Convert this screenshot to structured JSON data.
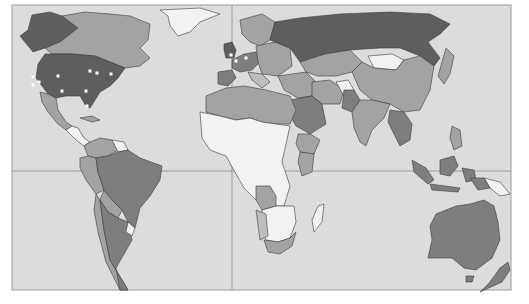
{
  "map": {
    "type": "world-choropleth",
    "projection": "world (Pacific-cut), equator and prime-meridian reference lines",
    "palette": {
      "ocean": "#dcdcdc",
      "frame": "#9a9a9a",
      "grid_line": "#8c8c8c",
      "level_1_lightest": "#f2f2f2",
      "level_2_light": "#bdbdbd",
      "level_3_medium": "#a3a3a3",
      "level_4_dark": "#7e7e7e",
      "level_5_darkest": "#5e5e5e",
      "marker": "#ffffff"
    },
    "regions": [
      {
        "name": "Alaska",
        "level": 5
      },
      {
        "name": "Canada",
        "level": 3
      },
      {
        "name": "Greenland",
        "level": 1
      },
      {
        "name": "United States",
        "level": 5
      },
      {
        "name": "Mexico",
        "level": 3
      },
      {
        "name": "Central America",
        "level": 1
      },
      {
        "name": "Caribbean",
        "level": 3
      },
      {
        "name": "Colombia / Venezuela",
        "level": 3
      },
      {
        "name": "Guianas",
        "level": 1
      },
      {
        "name": "Brazil",
        "level": 4
      },
      {
        "name": "Peru / Ecuador",
        "level": 3
      },
      {
        "name": "Bolivia",
        "level": 3
      },
      {
        "name": "Paraguay",
        "level": 3
      },
      {
        "name": "Chile",
        "level": 3
      },
      {
        "name": "Argentina",
        "level": 4
      },
      {
        "name": "Uruguay",
        "level": 1
      },
      {
        "name": "United Kingdom",
        "level": 5
      },
      {
        "name": "Scandinavia",
        "level": 3
      },
      {
        "name": "Western Europe",
        "level": 4
      },
      {
        "name": "Iberia",
        "level": 4
      },
      {
        "name": "Eastern Europe",
        "level": 3
      },
      {
        "name": "Russia",
        "level": 5
      },
      {
        "name": "Kazakhstan / Central Asia",
        "level": 3
      },
      {
        "name": "Mongolia",
        "level": 1
      },
      {
        "name": "China",
        "level": 3
      },
      {
        "name": "Japan / Korea",
        "level": 3
      },
      {
        "name": "Middle East",
        "level": 3
      },
      {
        "name": "Saudi Arabia",
        "level": 4
      },
      {
        "name": "Iran",
        "level": 3
      },
      {
        "name": "Afghanistan",
        "level": 1
      },
      {
        "name": "Pakistan",
        "level": 4
      },
      {
        "name": "India",
        "level": 3
      },
      {
        "name": "Southeast Asia",
        "level": 4
      },
      {
        "name": "Indonesia",
        "level": 4
      },
      {
        "name": "Philippines",
        "level": 3
      },
      {
        "name": "Papua New Guinea",
        "level": 1
      },
      {
        "name": "Australia",
        "level": 4
      },
      {
        "name": "New Zealand",
        "level": 4
      },
      {
        "name": "North Africa",
        "level": 3
      },
      {
        "name": "West / Central Africa",
        "level": 1
      },
      {
        "name": "Ethiopia",
        "level": 3
      },
      {
        "name": "Kenya",
        "level": 3
      },
      {
        "name": "Angola",
        "level": 3
      },
      {
        "name": "Southern Africa",
        "level": 1
      },
      {
        "name": "South Africa",
        "level": 3
      },
      {
        "name": "Madagascar",
        "level": 1
      }
    ],
    "markers": [
      {
        "region": "United States",
        "label": "US West Coast 1"
      },
      {
        "region": "United States",
        "label": "US West Coast 2"
      },
      {
        "region": "United States",
        "label": "US West Coast 3"
      },
      {
        "region": "United States",
        "label": "US Mountain"
      },
      {
        "region": "United States",
        "label": "US South"
      },
      {
        "region": "United States",
        "label": "US Midwest"
      },
      {
        "region": "United States",
        "label": "US Great Lakes"
      },
      {
        "region": "United States",
        "label": "US Northeast"
      },
      {
        "region": "United States",
        "label": "US Southeast"
      },
      {
        "region": "United States",
        "label": "US Florida"
      },
      {
        "region": "United Kingdom",
        "label": "London"
      },
      {
        "region": "Western Europe",
        "label": "Paris"
      },
      {
        "region": "Western Europe",
        "label": "Germany"
      }
    ]
  }
}
